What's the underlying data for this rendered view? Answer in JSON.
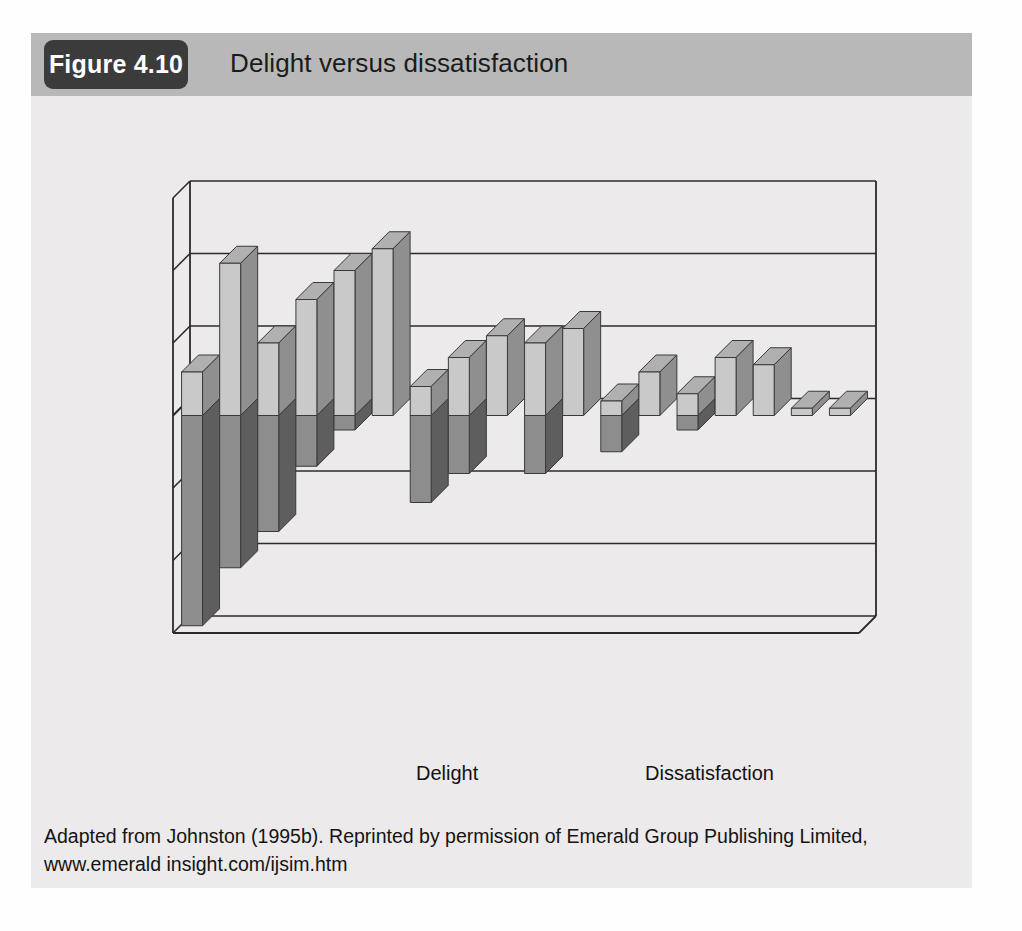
{
  "figure": {
    "badge_label": "Figure 4.10",
    "title": "Delight versus dissatisfaction",
    "caption": "Adapted from Johnston (1995b). Reprinted by permission of Emerald Group Publishing Limited, www.emerald insight.com/ijsim.htm"
  },
  "colors": {
    "header_band": "#b9b8b8",
    "badge_background": "#3b3b3b",
    "card_background": "#eceaea",
    "delight_front": "#8d8d8d",
    "delight_side": "#5e5e5e",
    "delight_top": "#a3a3a3",
    "dissatisfaction_front": "#c9c9c9",
    "dissatisfaction_side": "#8f8f8f",
    "dissatisfaction_top": "#b0b0b0",
    "axis_line": "#2b2b2b"
  },
  "chart_data": {
    "type": "bar",
    "title": "Delight versus dissatisfaction",
    "xlabel": "",
    "ylabel": "",
    "ylim": [
      -30,
      30
    ],
    "yticks": [
      30,
      20,
      10,
      0,
      -10,
      -20,
      -30
    ],
    "grid": true,
    "legend_position": "bottom",
    "three_d": true,
    "categories": [
      "Attentiveness",
      "Responsiveness",
      "Care",
      "Availability",
      "Reliability",
      "Integrity",
      "Friendliness",
      "Courtesy",
      "Communication",
      "Competence",
      "Functionality",
      "Commitment",
      "Access",
      "Flexibility",
      "Security",
      "Aesthetics",
      "Cleanliness",
      "Comfort"
    ],
    "series": [
      {
        "name": "Delight",
        "values": [
          6,
          21,
          10,
          16,
          20,
          23,
          4,
          8,
          11,
          10,
          12,
          2,
          6,
          3,
          8,
          7,
          1,
          1
        ]
      },
      {
        "name": "Dissatisfaction",
        "values": [
          -29,
          -21,
          -16,
          -7,
          -2,
          0,
          -12,
          -8,
          0,
          -8,
          0,
          -5,
          0,
          -2,
          0,
          0,
          0,
          0
        ]
      }
    ]
  },
  "legend": {
    "items": [
      {
        "label": "Delight",
        "swatch": "delight-cube"
      },
      {
        "label": "Dissatisfaction",
        "swatch": "dissatisfaction-cube"
      }
    ]
  }
}
